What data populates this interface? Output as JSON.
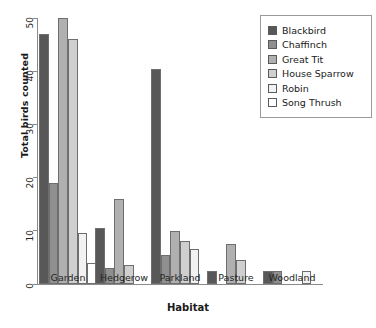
{
  "chart_data": {
    "type": "bar",
    "title": "",
    "subtitle": "",
    "xlabel": "Habitat",
    "ylabel": "Total birds counted",
    "categories": [
      "Garden",
      "Hedgerow",
      "Parkland",
      "Pasture",
      "Woodland"
    ],
    "ylim": [
      0,
      50
    ],
    "yticks": [
      0,
      10,
      20,
      30,
      40,
      50
    ],
    "ytick_labels": [
      "0",
      "10",
      "20",
      "30",
      "40",
      "50"
    ],
    "grid": false,
    "legend_position": "top-right",
    "series": [
      {
        "name": "Blackbird",
        "color": "#585858",
        "values": [
          47,
          10.5,
          40.5,
          2.5,
          2.5
        ]
      },
      {
        "name": "Chaffinch",
        "color": "#8f8f8f",
        "values": [
          19,
          3,
          5.5,
          0,
          2.5
        ]
      },
      {
        "name": "Great Tit",
        "color": "#b0b0b0",
        "values": [
          50,
          16,
          10,
          7.5,
          0
        ]
      },
      {
        "name": "House Sparrow",
        "color": "#cfcfcf",
        "values": [
          46,
          3.5,
          8,
          4.5,
          0
        ]
      },
      {
        "name": "Robin",
        "color": "#f2f2f2",
        "values": [
          9.5,
          0,
          6.5,
          0,
          2.5
        ]
      },
      {
        "name": "Song Thrush",
        "color": "#ffffff",
        "values": [
          4,
          0,
          0,
          0,
          0
        ]
      }
    ]
  }
}
